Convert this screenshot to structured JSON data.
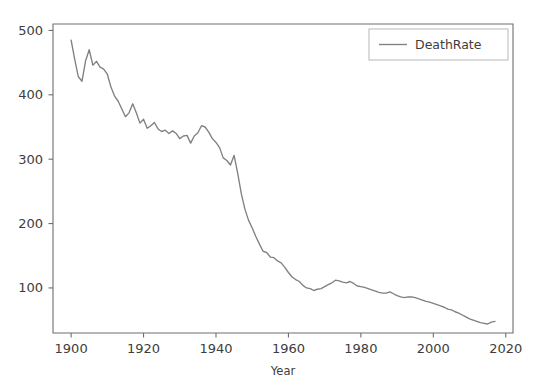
{
  "chart_data": {
    "type": "line",
    "title": "",
    "subtitle": "",
    "xlabel": "Year",
    "ylabel": "",
    "xlim": [
      1895,
      2022
    ],
    "ylim": [
      30,
      510
    ],
    "grid": false,
    "legend_position": "upper right",
    "line_color": "#808080",
    "axis_color": "#6e6e6e",
    "text_color": "#3d3d3d",
    "background_color": "#ffffff",
    "xticks": [
      1900,
      1920,
      1940,
      1960,
      1980,
      2000,
      2020
    ],
    "xtick_labels": [
      "1900",
      "1920",
      "1940",
      "1960",
      "1980",
      "2000",
      "2020"
    ],
    "yticks": [
      100,
      200,
      300,
      400,
      500
    ],
    "ytick_labels": [
      "100",
      "200",
      "300",
      "400",
      "500"
    ],
    "series": [
      {
        "name": "DeathRate",
        "x": [
          1900,
          1901,
          1902,
          1903,
          1904,
          1905,
          1906,
          1907,
          1908,
          1909,
          1910,
          1911,
          1912,
          1913,
          1914,
          1915,
          1916,
          1917,
          1918,
          1919,
          1920,
          1921,
          1922,
          1923,
          1924,
          1925,
          1926,
          1927,
          1928,
          1929,
          1930,
          1931,
          1932,
          1933,
          1934,
          1935,
          1936,
          1937,
          1938,
          1939,
          1940,
          1941,
          1942,
          1943,
          1944,
          1945,
          1946,
          1947,
          1948,
          1949,
          1950,
          1951,
          1952,
          1953,
          1954,
          1955,
          1956,
          1957,
          1958,
          1959,
          1960,
          1961,
          1962,
          1963,
          1964,
          1965,
          1966,
          1967,
          1968,
          1969,
          1970,
          1971,
          1972,
          1973,
          1974,
          1975,
          1976,
          1977,
          1978,
          1979,
          1980,
          1981,
          1982,
          1983,
          1984,
          1985,
          1986,
          1987,
          1988,
          1989,
          1990,
          1991,
          1992,
          1993,
          1994,
          1995,
          1996,
          1997,
          1998,
          1999,
          2000,
          2001,
          2002,
          2003,
          2004,
          2005,
          2006,
          2007,
          2008,
          2009,
          2010,
          2011,
          2012,
          2013,
          2014,
          2015,
          2016,
          2017
        ],
        "values": [
          485,
          455,
          428,
          421,
          453,
          470,
          446,
          452,
          443,
          440,
          432,
          412,
          398,
          390,
          378,
          366,
          372,
          386,
          372,
          356,
          362,
          348,
          352,
          357,
          347,
          343,
          345,
          340,
          344,
          340,
          332,
          336,
          337,
          325,
          336,
          341,
          352,
          350,
          342,
          332,
          326,
          318,
          302,
          298,
          291,
          306,
          278,
          246,
          222,
          205,
          193,
          180,
          168,
          157,
          155,
          148,
          147,
          142,
          139,
          132,
          124,
          117,
          113,
          110,
          104,
          100,
          99,
          96,
          98,
          99,
          102,
          105,
          108,
          112,
          111,
          109,
          108,
          110,
          107,
          103,
          102,
          101,
          99,
          97,
          95,
          93,
          92,
          92,
          94,
          91,
          88,
          86,
          85,
          86,
          86,
          85,
          83,
          81,
          79,
          78,
          76,
          74,
          72,
          70,
          67,
          66,
          63,
          61,
          58,
          55,
          52,
          50,
          48,
          46,
          45,
          44,
          47,
          48
        ]
      }
    ],
    "legend": [
      {
        "label": "DeathRate",
        "color": "#808080",
        "style": "line"
      }
    ],
    "annotations": []
  }
}
